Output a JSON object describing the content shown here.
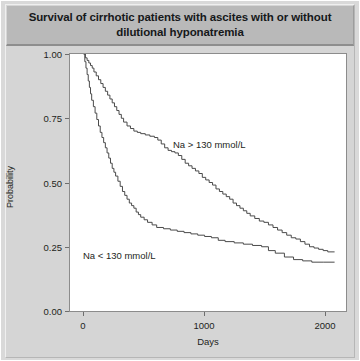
{
  "figure": {
    "title": "Survival of cirrhotic patients with ascites with or without dilutional hyponatremia"
  },
  "axes": {
    "ylabel": "Probability",
    "xlabel": "Days",
    "yticks": [
      "0.00",
      "0.25",
      "0.50",
      "0.75",
      "1.00"
    ],
    "xticks": [
      "0",
      "1000",
      "2000"
    ]
  },
  "annotations": {
    "high_sodium": "Na > 130 mmol/L",
    "low_sodium": "Na < 130 mmol/L"
  },
  "chart_data": {
    "type": "line",
    "subtype": "kaplan-meier-step",
    "title": "Survival of cirrhotic patients with ascites with or without dilutional hyponatremia",
    "xlabel": "Days",
    "ylabel": "Probability",
    "xlim": [
      -120,
      2300
    ],
    "ylim": [
      0.0,
      1.0
    ],
    "xticks": [
      0,
      1000,
      2000
    ],
    "yticks": [
      0.0,
      0.25,
      0.5,
      0.75,
      1.0
    ],
    "grid": false,
    "legend": "inline-annotations",
    "line_color": "#4a4a4a",
    "series": [
      {
        "name": "Na > 130 mmol/L",
        "label_position": {
          "x": 760,
          "y": 0.62
        },
        "points": [
          [
            0,
            1.0
          ],
          [
            15,
            0.985
          ],
          [
            30,
            0.975
          ],
          [
            45,
            0.965
          ],
          [
            60,
            0.955
          ],
          [
            75,
            0.945
          ],
          [
            90,
            0.93
          ],
          [
            110,
            0.915
          ],
          [
            130,
            0.9
          ],
          [
            150,
            0.885
          ],
          [
            170,
            0.87
          ],
          [
            190,
            0.855
          ],
          [
            210,
            0.84
          ],
          [
            230,
            0.825
          ],
          [
            250,
            0.81
          ],
          [
            270,
            0.795
          ],
          [
            290,
            0.78
          ],
          [
            310,
            0.765
          ],
          [
            330,
            0.75
          ],
          [
            350,
            0.735
          ],
          [
            380,
            0.72
          ],
          [
            410,
            0.71
          ],
          [
            440,
            0.7
          ],
          [
            470,
            0.695
          ],
          [
            500,
            0.69
          ],
          [
            540,
            0.685
          ],
          [
            580,
            0.68
          ],
          [
            620,
            0.675
          ],
          [
            650,
            0.665
          ],
          [
            680,
            0.65
          ],
          [
            710,
            0.635
          ],
          [
            740,
            0.625
          ],
          [
            770,
            0.62
          ],
          [
            800,
            0.615
          ],
          [
            830,
            0.605
          ],
          [
            860,
            0.59
          ],
          [
            890,
            0.575
          ],
          [
            920,
            0.565
          ],
          [
            950,
            0.555
          ],
          [
            980,
            0.545
          ],
          [
            1010,
            0.535
          ],
          [
            1040,
            0.52
          ],
          [
            1070,
            0.51
          ],
          [
            1100,
            0.5
          ],
          [
            1130,
            0.49
          ],
          [
            1160,
            0.475
          ],
          [
            1190,
            0.465
          ],
          [
            1220,
            0.455
          ],
          [
            1250,
            0.445
          ],
          [
            1280,
            0.435
          ],
          [
            1310,
            0.42
          ],
          [
            1340,
            0.41
          ],
          [
            1370,
            0.4
          ],
          [
            1400,
            0.39
          ],
          [
            1430,
            0.38
          ],
          [
            1460,
            0.37
          ],
          [
            1500,
            0.36
          ],
          [
            1540,
            0.35
          ],
          [
            1580,
            0.345
          ],
          [
            1620,
            0.335
          ],
          [
            1660,
            0.325
          ],
          [
            1700,
            0.315
          ],
          [
            1740,
            0.305
          ],
          [
            1780,
            0.295
          ],
          [
            1820,
            0.285
          ],
          [
            1860,
            0.28
          ],
          [
            1900,
            0.27
          ],
          [
            1940,
            0.26
          ],
          [
            1980,
            0.25
          ],
          [
            2020,
            0.245
          ],
          [
            2060,
            0.24
          ],
          [
            2100,
            0.235
          ],
          [
            2140,
            0.23
          ],
          [
            2200,
            0.23
          ]
        ]
      },
      {
        "name": "Na < 130 mmol/L",
        "label_position": {
          "x": 180,
          "y": 0.215
        },
        "points": [
          [
            0,
            1.0
          ],
          [
            10,
            0.97
          ],
          [
            20,
            0.945
          ],
          [
            30,
            0.92
          ],
          [
            40,
            0.895
          ],
          [
            50,
            0.87
          ],
          [
            60,
            0.845
          ],
          [
            70,
            0.82
          ],
          [
            85,
            0.795
          ],
          [
            100,
            0.77
          ],
          [
            115,
            0.745
          ],
          [
            130,
            0.72
          ],
          [
            145,
            0.695
          ],
          [
            160,
            0.675
          ],
          [
            175,
            0.655
          ],
          [
            190,
            0.635
          ],
          [
            205,
            0.615
          ],
          [
            220,
            0.595
          ],
          [
            235,
            0.575
          ],
          [
            250,
            0.555
          ],
          [
            265,
            0.54
          ],
          [
            280,
            0.525
          ],
          [
            300,
            0.505
          ],
          [
            320,
            0.485
          ],
          [
            340,
            0.465
          ],
          [
            360,
            0.45
          ],
          [
            380,
            0.435
          ],
          [
            400,
            0.42
          ],
          [
            420,
            0.41
          ],
          [
            440,
            0.4
          ],
          [
            460,
            0.385
          ],
          [
            480,
            0.375
          ],
          [
            500,
            0.365
          ],
          [
            530,
            0.355
          ],
          [
            560,
            0.345
          ],
          [
            600,
            0.335
          ],
          [
            640,
            0.325
          ],
          [
            700,
            0.32
          ],
          [
            760,
            0.315
          ],
          [
            820,
            0.31
          ],
          [
            880,
            0.305
          ],
          [
            940,
            0.3
          ],
          [
            1000,
            0.295
          ],
          [
            1060,
            0.29
          ],
          [
            1120,
            0.285
          ],
          [
            1180,
            0.275
          ],
          [
            1240,
            0.27
          ],
          [
            1320,
            0.265
          ],
          [
            1400,
            0.26
          ],
          [
            1480,
            0.255
          ],
          [
            1560,
            0.25
          ],
          [
            1620,
            0.235
          ],
          [
            1680,
            0.225
          ],
          [
            1760,
            0.21
          ],
          [
            1840,
            0.2
          ],
          [
            1920,
            0.195
          ],
          [
            2000,
            0.19
          ],
          [
            2100,
            0.19
          ],
          [
            2200,
            0.19
          ]
        ]
      }
    ]
  }
}
